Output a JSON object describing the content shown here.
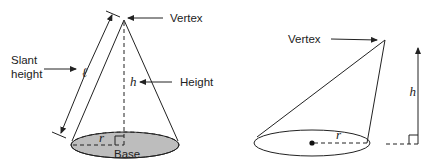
{
  "left_cone": {
    "vertex_label": "Vertex",
    "slant_label_line1": "Slant",
    "slant_label_line2": "height",
    "slant_symbol": "ℓ",
    "height_symbol": "h",
    "height_label": "Height",
    "radius_symbol": "r",
    "base_label": "Base",
    "base_fill": "#bdbdbd"
  },
  "right_cone": {
    "vertex_label": "Vertex",
    "height_symbol": "h",
    "radius_symbol": "r"
  }
}
